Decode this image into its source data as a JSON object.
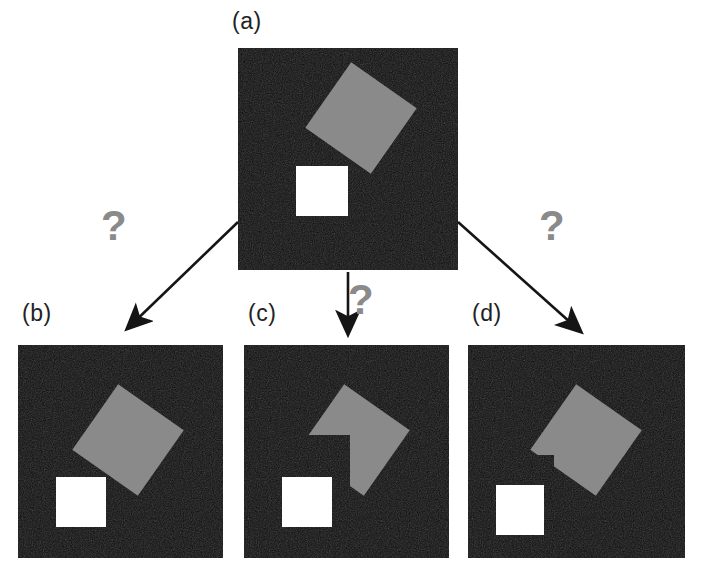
{
  "figure": {
    "background_color": "#ffffff",
    "panel_noise_color": "#111111",
    "panel_noise_color_2": "#2a2a2a",
    "shape_gray": "#8a8a8a",
    "shape_white": "#ffffff",
    "arrow_color": "#151515",
    "question_color": "#8a8a8a",
    "label_color": "#222222"
  },
  "panels": [
    {
      "id": "a",
      "label": "(a)",
      "label_x": 232,
      "label_y": 8,
      "x": 238,
      "y": 48,
      "width": 220,
      "height": 222,
      "description": "gray diamond partly occluded by a white square at lower left",
      "diamond": {
        "cx": 123,
        "cy": 70,
        "half": 56,
        "rotation_deg": -10
      },
      "square": {
        "x": 58,
        "y": 118,
        "w": 52,
        "h": 50
      },
      "square_on_top": true,
      "notch": null
    },
    {
      "id": "b",
      "label": "(b)",
      "label_x": 22,
      "label_y": 300,
      "x": 18,
      "y": 345,
      "width": 205,
      "height": 213,
      "description": "complete gray diamond and a separate white square, no overlap",
      "diamond": {
        "cx": 110,
        "cy": 95,
        "half": 56,
        "rotation_deg": -10
      },
      "square": {
        "x": 38,
        "y": 132,
        "w": 50,
        "h": 50
      },
      "square_on_top": false,
      "notch": null
    },
    {
      "id": "c",
      "label": "(c)",
      "label_x": 248,
      "label_y": 300,
      "x": 244,
      "y": 345,
      "width": 205,
      "height": 213,
      "description": "gray diamond with a large square notch removed from its lower-left side",
      "diamond": {
        "cx": 110,
        "cy": 95,
        "half": 56,
        "rotation_deg": -10
      },
      "square": {
        "x": 38,
        "y": 132,
        "w": 50,
        "h": 50
      },
      "square_on_top": false,
      "notch": {
        "x": 48,
        "y": 92,
        "w": 56,
        "h": 56
      }
    },
    {
      "id": "d",
      "label": "(d)",
      "label_x": 472,
      "label_y": 300,
      "x": 468,
      "y": 345,
      "width": 217,
      "height": 213,
      "description": "gray diamond with a small sliver notch removed from its lower-left edge",
      "diamond": {
        "cx": 118,
        "cy": 95,
        "half": 56,
        "rotation_deg": -10
      },
      "square": {
        "x": 28,
        "y": 140,
        "w": 48,
        "h": 50
      },
      "square_on_top": false,
      "notch": {
        "x": 52,
        "y": 112,
        "w": 32,
        "h": 34
      }
    }
  ],
  "arrows": [
    {
      "id": "left",
      "from_x": 238,
      "from_y": 222,
      "to_x": 123,
      "to_y": 333,
      "points_to": "b"
    },
    {
      "id": "middle",
      "from_x": 348,
      "from_y": 272,
      "to_x": 348,
      "to_y": 338,
      "points_to": "c"
    },
    {
      "id": "right",
      "from_x": 458,
      "from_y": 222,
      "to_x": 585,
      "to_y": 335,
      "points_to": "d"
    }
  ],
  "question_marks": [
    {
      "id": "left",
      "text": "?",
      "x": 101,
      "y": 213
    },
    {
      "id": "middle",
      "text": "?",
      "x": 348,
      "y": 283
    },
    {
      "id": "right",
      "text": "?",
      "x": 539,
      "y": 213
    }
  ]
}
